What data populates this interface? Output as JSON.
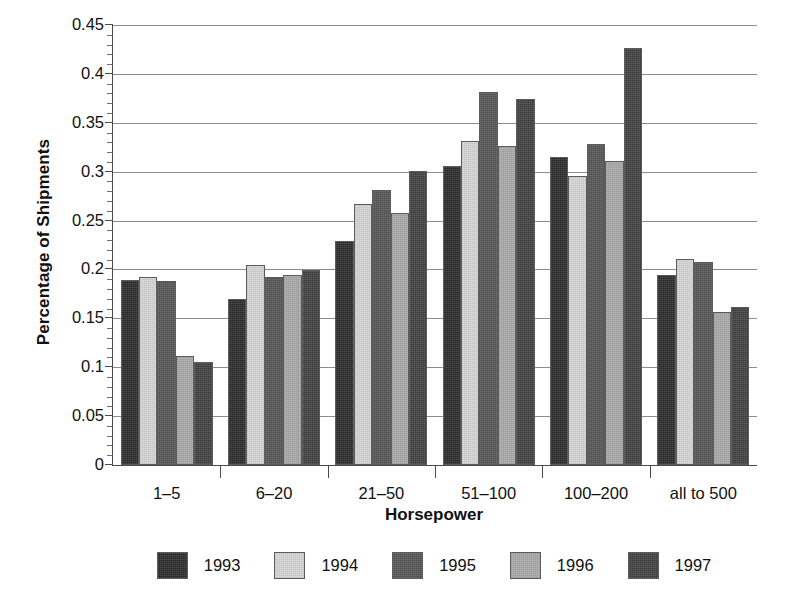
{
  "chart_data": {
    "type": "bar",
    "title": "",
    "xlabel": "Horsepower",
    "ylabel": "Percentage of Shipments",
    "categories": [
      "1–5",
      "6–20",
      "21–50",
      "51–100",
      "100–200",
      "all to 500"
    ],
    "series": [
      {
        "name": "1993",
        "color": "#262626",
        "values": [
          0.189,
          0.17,
          0.229,
          0.306,
          0.315,
          0.194
        ]
      },
      {
        "name": "1994",
        "color": "#dcdcdc",
        "values": [
          0.192,
          0.205,
          0.267,
          0.331,
          0.296,
          0.211
        ]
      },
      {
        "name": "1995",
        "color": "#4f4f4f",
        "values": [
          0.188,
          0.192,
          0.281,
          0.382,
          0.328,
          0.208
        ]
      },
      {
        "name": "1996",
        "color": "#b4b4b4",
        "values": [
          0.112,
          0.194,
          0.258,
          0.326,
          0.311,
          0.156
        ]
      },
      {
        "name": "1997",
        "color": "#3a3a3a",
        "values": [
          0.105,
          0.199,
          0.301,
          0.374,
          0.426,
          0.162
        ]
      }
    ],
    "ylim": [
      0,
      0.45
    ],
    "ytick_labels": [
      "0",
      "0.05",
      "0.1",
      "0.15",
      "0.2",
      "0.25",
      "0.3",
      "0.35",
      "0.4",
      "0.45"
    ],
    "ytick_values": [
      0,
      0.05,
      0.1,
      0.15,
      0.2,
      0.25,
      0.3,
      0.35,
      0.4,
      0.45
    ],
    "yminor_step": 0.01,
    "grid": "horizontal",
    "legend_position": "bottom",
    "legend_entries": [
      "1993",
      "1994",
      "1995",
      "1996",
      "1997"
    ]
  }
}
